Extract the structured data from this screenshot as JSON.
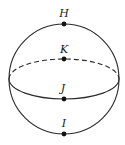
{
  "diagram": {
    "type": "sphere",
    "stroke_color": "#2a2a2a",
    "background": "#ffffff",
    "sphere": {
      "cx": 64,
      "cy": 79,
      "r": 55
    },
    "equator": {
      "cx": 64,
      "cy": 79,
      "rx": 55,
      "ry": 20,
      "back_style": "dashed",
      "front_style": "solid"
    },
    "points": [
      {
        "label": "H",
        "x": 64,
        "y": 24,
        "label_x": 64,
        "label_y": 17,
        "position": "top of sphere"
      },
      {
        "label": "K",
        "x": 64,
        "y": 59,
        "label_x": 64,
        "label_y": 53,
        "position": "back of equator"
      },
      {
        "label": "J",
        "x": 64,
        "y": 99,
        "label_x": 63,
        "label_y": 92,
        "position": "front of equator"
      },
      {
        "label": "I",
        "x": 64,
        "y": 134,
        "label_x": 64,
        "label_y": 127,
        "position": "bottom of sphere"
      }
    ]
  }
}
